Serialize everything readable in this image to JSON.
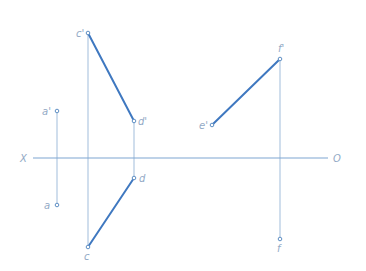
{
  "diagram": {
    "type": "orthographic-projection",
    "colors": {
      "projection_line": "#a9c3de",
      "axis": "#7fa6d2",
      "segment": "#3f78c0",
      "label": "#93aac6"
    },
    "axis": {
      "left_label": "X",
      "right_label": "O",
      "y": 158,
      "x1": 33,
      "x2": 328
    },
    "points": {
      "a_prime": {
        "label": "a'",
        "x": 57,
        "y": 111
      },
      "a": {
        "label": "a",
        "x": 57,
        "y": 205
      },
      "c_prime": {
        "label": "c'",
        "x": 88,
        "y": 33
      },
      "c": {
        "label": "c",
        "x": 88,
        "y": 247
      },
      "d_prime": {
        "label": "d'",
        "x": 134,
        "y": 121
      },
      "d": {
        "label": "d",
        "x": 134,
        "y": 178
      },
      "e_prime": {
        "label": "e'",
        "x": 212,
        "y": 125
      },
      "f_prime": {
        "label": "f'",
        "x": 280,
        "y": 59
      },
      "f": {
        "label": "f",
        "x": 280,
        "y": 239
      }
    },
    "segments": [
      {
        "name": "c'd'",
        "from": "c_prime",
        "to": "d_prime"
      },
      {
        "name": "cd",
        "from": "c",
        "to": "d"
      },
      {
        "name": "e'f'",
        "from": "e_prime",
        "to": "f_prime"
      }
    ]
  }
}
